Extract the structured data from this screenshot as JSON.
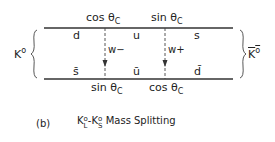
{
  "diagram": {
    "left_meson": {
      "base": "K",
      "sup": "o"
    },
    "right_meson": {
      "base": "K",
      "sup": "o",
      "bar": true
    },
    "top_labels": [
      {
        "text": "cos θ",
        "sub": "C"
      },
      {
        "text": "sin θ",
        "sub": "C"
      }
    ],
    "bottom_labels": [
      {
        "text": "sin θ",
        "sub": "C"
      },
      {
        "text": "cos θ",
        "sub": "C"
      }
    ],
    "top_quarks": [
      "d",
      "u",
      "s"
    ],
    "bottom_quarks": [
      "s̄",
      "ū",
      "d̄"
    ],
    "bosons": [
      "w−",
      "w+"
    ]
  },
  "caption": {
    "label": "(b)",
    "k1": "K",
    "k1_sup": "o",
    "k1_sub": "L",
    "dash": "-",
    "k2": "K",
    "k2_sup": "o",
    "k2_sub": "S",
    "text": "Mass Splitting"
  }
}
